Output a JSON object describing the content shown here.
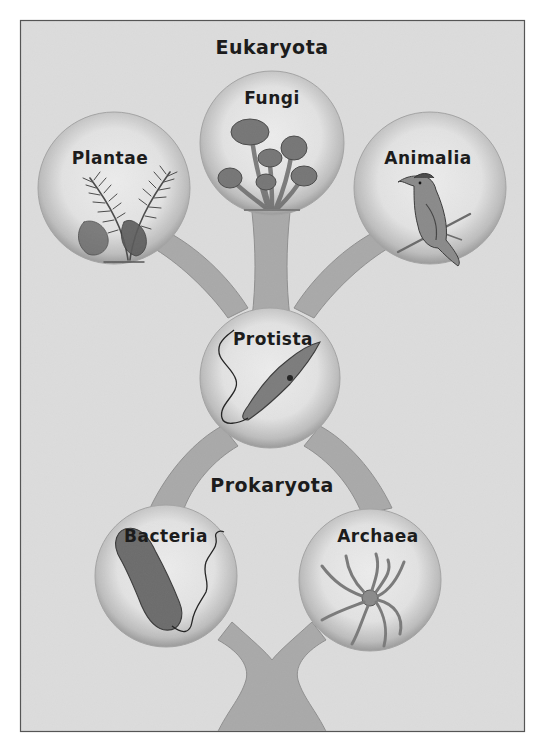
{
  "diagram": {
    "type": "tree-of-life",
    "colors": {
      "page": "#ffffff",
      "paper": "#dcdcdc",
      "frame": "#555555",
      "tube": "#a9a9a9",
      "tube_edge": "#8f8f8f",
      "node_inner": "#e6e6e6",
      "node_rim": "#9c9c9c",
      "ink": "#1c1c1c"
    },
    "groups": {
      "eukaryota": "Eukaryota",
      "prokaryota": "Prokaryota"
    },
    "nodes": [
      {
        "id": "plantae",
        "label": "Plantae",
        "group": "eukaryota",
        "illustration": "fern-icon"
      },
      {
        "id": "fungi",
        "label": "Fungi",
        "group": "eukaryota",
        "illustration": "mushroom-icon"
      },
      {
        "id": "animalia",
        "label": "Animalia",
        "group": "eukaryota",
        "illustration": "bird-icon"
      },
      {
        "id": "protista",
        "label": "Protista",
        "group": "eukaryota",
        "illustration": "protozoan-icon"
      },
      {
        "id": "bacteria",
        "label": "Bacteria",
        "group": "prokaryota",
        "illustration": "bacterium-icon"
      },
      {
        "id": "archaea",
        "label": "Archaea",
        "group": "prokaryota",
        "illustration": "archaeon-icon"
      }
    ],
    "edges": [
      {
        "from": "root",
        "to": "bacteria"
      },
      {
        "from": "root",
        "to": "archaea"
      },
      {
        "from": "bacteria",
        "to": "protista"
      },
      {
        "from": "archaea",
        "to": "protista"
      },
      {
        "from": "protista",
        "to": "plantae"
      },
      {
        "from": "protista",
        "to": "fungi"
      },
      {
        "from": "protista",
        "to": "animalia"
      }
    ]
  }
}
